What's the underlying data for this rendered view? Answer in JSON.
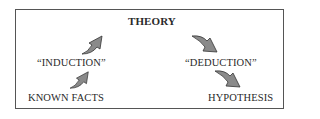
{
  "diagram": {
    "title": "THEORY",
    "nodes": {
      "induction": "“INDUCTION”",
      "known_facts": "KNOWN FACTS",
      "deduction": "“DEDUCTION”",
      "hypothesis": "HYPOTHESIS"
    },
    "arrows": [
      {
        "from": "known_facts",
        "to": "induction",
        "direction": "up-right"
      },
      {
        "from": "induction",
        "to": "theory",
        "direction": "up-right"
      },
      {
        "from": "theory",
        "to": "deduction",
        "direction": "down-right"
      },
      {
        "from": "deduction",
        "to": "hypothesis",
        "direction": "down-right"
      }
    ],
    "colors": {
      "arrow_fill": "#8a8a8a",
      "arrow_stroke": "#333333",
      "border": "#555555"
    }
  }
}
